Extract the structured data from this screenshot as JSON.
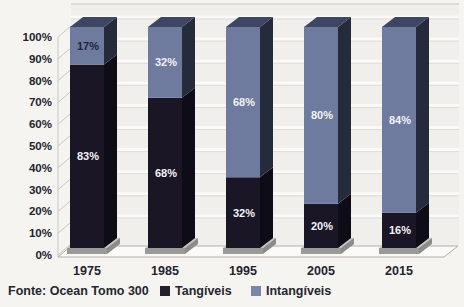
{
  "chart_data": {
    "type": "bar",
    "stacked": true,
    "pseudo_3d": true,
    "categories": [
      "1975",
      "1985",
      "1995",
      "2005",
      "2015"
    ],
    "series": [
      {
        "name": "Tangíveis",
        "values": [
          83,
          68,
          32,
          20,
          16
        ],
        "color": "#1a1626",
        "side_color": "#0e0c16",
        "label_colors": [
          "#f4f3f5",
          "#f4f3f5",
          "#f4f3f5",
          "#f4f3f5",
          "#f4f3f5"
        ]
      },
      {
        "name": "Intangíveis",
        "values": [
          17,
          32,
          68,
          80,
          84
        ],
        "color": "#6e7a9e",
        "top_color": "#3d4663",
        "side_color": "#262b3b",
        "label_colors": [
          "#20243a",
          "#f4f3f5",
          "#f4f3f5",
          "#f4f3f5",
          "#f4f3f5"
        ]
      }
    ],
    "y_ticks": [
      "100%",
      "90%",
      "80%",
      "70%",
      "60%",
      "50%",
      "40%",
      "30%",
      "20%",
      "10%",
      "0%"
    ],
    "ylim": [
      0,
      100
    ],
    "grid": true,
    "legend_position": "bottom",
    "value_suffix": "%"
  },
  "footer": {
    "source": "Fonte: Ocean Tomo 300",
    "legend": [
      {
        "label": "Tangíveis",
        "color": "#23202e"
      },
      {
        "label": "Intangíveis",
        "color": "#7b86a6"
      }
    ]
  },
  "colors": {
    "background": "#f5f4f1",
    "plot_bg": "#f0efec",
    "gridline": "#fbfaf8",
    "grid_shadow": "#dedcd7",
    "wall_line": "#c9c7c2",
    "floor_fill": "#fbfaf8",
    "floor_edge": "#b3afa9",
    "pedestal": "#9a9a98",
    "pedestal_top": "#c4c4c2",
    "pedestal_side": "#8b8b89",
    "axis_text": "#23232e"
  }
}
